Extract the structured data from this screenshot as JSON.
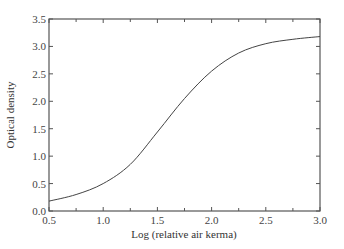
{
  "chart_data": {
    "type": "line",
    "title": "",
    "xlabel": "Log (relative air kerma)",
    "ylabel": "Optical density",
    "xlim": [
      0.5,
      3.0
    ],
    "ylim": [
      0.0,
      3.5
    ],
    "xticks": [
      "0.5",
      "1.0",
      "1.5",
      "2.0",
      "2.5",
      "3.0"
    ],
    "yticks": [
      "0.0",
      "0.5",
      "1.0",
      "1.5",
      "2.0",
      "2.5",
      "3.0",
      "3.5"
    ],
    "grid": false,
    "series": [
      {
        "name": "characteristic curve",
        "x": [
          0.5,
          0.75,
          1.0,
          1.25,
          1.5,
          1.75,
          2.0,
          2.25,
          2.5,
          2.75,
          3.0
        ],
        "y": [
          0.18,
          0.3,
          0.5,
          0.85,
          1.44,
          2.05,
          2.55,
          2.88,
          3.05,
          3.13,
          3.18
        ]
      }
    ]
  }
}
